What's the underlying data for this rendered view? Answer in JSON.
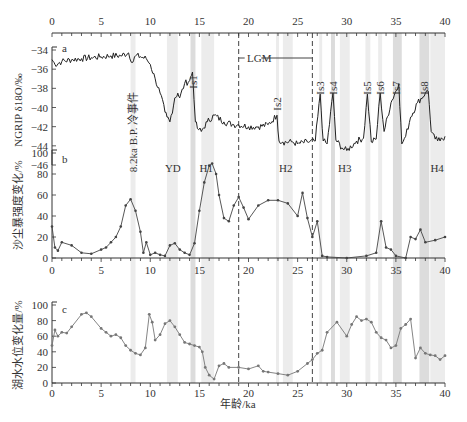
{
  "chart_data": [
    {
      "panel": "a",
      "type": "line",
      "ylabel": "NGRIP δ18O/‰",
      "xlabel": "年龄/ka",
      "xlim": [
        0,
        40
      ],
      "ylim": [
        -46,
        -34
      ],
      "yticks": [
        -34,
        -36,
        -38,
        -40,
        -42,
        -44,
        -46
      ],
      "xticks": [
        0,
        5,
        10,
        15,
        20,
        25,
        30,
        35,
        40
      ],
      "x": [
        0,
        0.3,
        1,
        2,
        3,
        4,
        5,
        6,
        7,
        7.8,
        8.2,
        8.5,
        9,
        9.6,
        10,
        10.5,
        11,
        11.5,
        11.7,
        12,
        12.5,
        12.8,
        13,
        13.5,
        14,
        14.3,
        14.6,
        14.8,
        15.2,
        15.8,
        16.5,
        17.5,
        18.5,
        19,
        20,
        21,
        22,
        22.9,
        23.1,
        23.5,
        24.5,
        25,
        26,
        26.8,
        27.3,
        27.6,
        28,
        28.6,
        28.9,
        29.5,
        30,
        31,
        31.7,
        32.1,
        32.5,
        33,
        33.4,
        33.8,
        34.5,
        35.3,
        35.6,
        36,
        36.5,
        37.2,
        38,
        38.3,
        38.6,
        39,
        39.5,
        40
      ],
      "values": [
        -35,
        -35.5,
        -35.2,
        -35,
        -34.9,
        -34.8,
        -34.7,
        -34.6,
        -34.6,
        -34.3,
        -35.3,
        -34.6,
        -34.7,
        -34.9,
        -35.5,
        -37,
        -38.5,
        -40.5,
        -41,
        -41.5,
        -39,
        -38.5,
        -39,
        -37.5,
        -37.2,
        -36.3,
        -41.5,
        -42.2,
        -42.5,
        -41.5,
        -40.8,
        -41.5,
        -41.8,
        -41.8,
        -42,
        -42,
        -41.8,
        -40.8,
        -43.5,
        -43.6,
        -43.6,
        -43.8,
        -43.6,
        -43.5,
        -38.6,
        -43.5,
        -43.8,
        -38.5,
        -43.4,
        -44.2,
        -44.5,
        -43.5,
        -43.2,
        -38.6,
        -43.6,
        -43.3,
        -38.5,
        -42.5,
        -39.5,
        -37.5,
        -43.8,
        -43,
        -41,
        -39.5,
        -38.5,
        -38.3,
        -42.5,
        -43.3,
        -43.5,
        -43
      ]
    },
    {
      "panel": "b",
      "type": "line",
      "ylabel": "沙尘暴强度变化/%",
      "xlim": [
        0,
        40
      ],
      "ylim": [
        0,
        100
      ],
      "yticks": [
        0,
        20,
        40,
        60,
        80,
        100
      ],
      "xticks": [
        0,
        5,
        10,
        15,
        20,
        25,
        30,
        35,
        40
      ],
      "x": [
        0,
        0.3,
        0.6,
        1,
        2,
        3,
        4,
        5,
        5.5,
        6,
        6.5,
        7,
        7.5,
        8,
        8.5,
        9,
        9.3,
        9.6,
        10,
        10.5,
        11,
        11.5,
        12,
        12.5,
        13,
        13.5,
        14,
        14.5,
        15,
        15.5,
        16,
        16.3,
        16.7,
        17,
        17.5,
        18,
        18.5,
        19,
        19.5,
        20,
        21,
        22,
        23,
        24,
        25,
        25.5,
        26,
        26.5,
        27,
        27.5,
        28,
        30,
        32,
        33,
        33.5,
        34,
        34.5,
        35,
        36,
        36.5,
        37,
        37.5,
        38,
        39,
        40
      ],
      "values": [
        30,
        10,
        7,
        15,
        12,
        5,
        4,
        8,
        10,
        15,
        20,
        30,
        50,
        56,
        45,
        25,
        5,
        15,
        3,
        5,
        3,
        2,
        12,
        14,
        8,
        5,
        3,
        14,
        45,
        72,
        88,
        90,
        80,
        60,
        38,
        35,
        50,
        58,
        48,
        37,
        50,
        55,
        55,
        52,
        40,
        62,
        38,
        20,
        35,
        2,
        1,
        0,
        2,
        5,
        35,
        10,
        8,
        2,
        0,
        20,
        18,
        27,
        15,
        17,
        20
      ]
    },
    {
      "panel": "c",
      "type": "line",
      "ylabel": "湖水水位变化量/%",
      "xlim": [
        0,
        40
      ],
      "ylim": [
        0,
        100
      ],
      "yticks": [
        0,
        20,
        40,
        60,
        80,
        100
      ],
      "xticks": [
        0,
        5,
        10,
        15,
        20,
        25,
        30,
        35,
        40
      ],
      "x": [
        0,
        0.3,
        0.6,
        1,
        1.5,
        2,
        3,
        3.5,
        4,
        5,
        5.5,
        6,
        6.5,
        7,
        7.5,
        8,
        8.5,
        9,
        9.5,
        9.9,
        10.2,
        10.5,
        11,
        11.5,
        12,
        12.5,
        13,
        13.5,
        14,
        14.5,
        15,
        15.3,
        15.6,
        16,
        16.5,
        17,
        17.5,
        18,
        19,
        20,
        21,
        21.5,
        22,
        23,
        24,
        25,
        26,
        26.5,
        27,
        27.5,
        28,
        29,
        30,
        30.5,
        31,
        31.5,
        32,
        32.5,
        33,
        33.5,
        34,
        34.5,
        35,
        35.5,
        36,
        36.5,
        37,
        37.5,
        38,
        38.5,
        39,
        39.5,
        40
      ],
      "values": [
        48,
        68,
        60,
        65,
        64,
        72,
        88,
        90,
        85,
        70,
        65,
        60,
        62,
        58,
        48,
        42,
        38,
        36,
        45,
        88,
        78,
        55,
        62,
        76,
        80,
        72,
        62,
        52,
        50,
        48,
        46,
        40,
        20,
        10,
        5,
        22,
        25,
        20,
        20,
        18,
        22,
        15,
        14,
        12,
        10,
        15,
        25,
        30,
        38,
        42,
        65,
        78,
        60,
        75,
        85,
        80,
        82,
        78,
        65,
        58,
        55,
        45,
        48,
        70,
        75,
        82,
        32,
        45,
        38,
        36,
        35,
        30,
        35
      ]
    }
  ],
  "figure": {
    "top_axis_ticks": [
      "0",
      "5",
      "10",
      "15",
      "20",
      "25",
      "30",
      "35",
      "40"
    ],
    "mid_axis_ticks": [
      "0",
      "5",
      "10",
      "15",
      "20",
      "25",
      "30",
      "35",
      "40"
    ],
    "bottom_axis_ticks": [
      "0",
      "5",
      "10",
      "15",
      "20",
      "25",
      "30",
      "35",
      "40"
    ],
    "xlabel": "年龄/ka",
    "panel_a": {
      "letter": "a",
      "ylabel": "NGRIP δ18O/‰",
      "yticks": [
        "-34",
        "-36",
        "-38",
        "-40",
        "-42",
        "-44",
        "-46"
      ]
    },
    "panel_b": {
      "letter": "b",
      "ylabel": "沙尘暴强度变化/%",
      "yticks": [
        "100",
        "80",
        "60",
        "40",
        "20",
        "0"
      ]
    },
    "panel_c": {
      "letter": "c",
      "ylabel": "湖水水位变化量/%",
      "yticks": [
        "100",
        "80",
        "60",
        "40",
        "20",
        "0"
      ]
    },
    "annotations": {
      "event_82": "8.2ka B.P. 冷事件",
      "lgm": "LGM",
      "is_labels": [
        "Is1",
        "Is2",
        "Is3",
        "Is4",
        "Is5",
        "Is6",
        "Is7",
        "Is8"
      ],
      "h_labels": [
        "YD",
        "H1",
        "H2",
        "H3",
        "H4"
      ]
    },
    "colors": {
      "band_light": "#ececec",
      "band_dark": "#dcdcdc",
      "line_a": "#222222",
      "line_b": "#444444",
      "line_c": "#777777",
      "axis": "#333333"
    }
  }
}
